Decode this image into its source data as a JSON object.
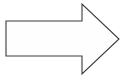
{
  "canvas": {
    "width": 126,
    "height": 77,
    "background_color": "#ffffff",
    "description": "right-pointing-arrow-outline"
  },
  "shape": {
    "name": "right-arrow",
    "icon_name": "arrow-right-icon",
    "fill_color": "#fefefe",
    "stroke_color": "#3a3a3a",
    "stroke_width": 1.1,
    "points": "6,21 82,21 82,4 119,39 82,74 82,56 6,56",
    "vertices": [
      {
        "label": "shaft-top-left",
        "x": 6,
        "y": 21
      },
      {
        "label": "shaft-top-right",
        "x": 82,
        "y": 21
      },
      {
        "label": "head-top-corner",
        "x": 82,
        "y": 4
      },
      {
        "label": "arrow-tip",
        "x": 119,
        "y": 39
      },
      {
        "label": "head-bottom-corner",
        "x": 82,
        "y": 74
      },
      {
        "label": "shaft-bottom-right",
        "x": 82,
        "y": 56
      },
      {
        "label": "shaft-bottom-left",
        "x": 6,
        "y": 56
      }
    ],
    "direction": "right"
  }
}
